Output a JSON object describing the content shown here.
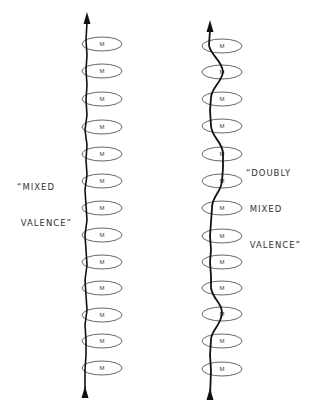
{
  "diagram": {
    "left_chain": {
      "label_lines": [
        "“MIXED",
        " VALENCE”"
      ],
      "site_label": "M",
      "site_count": 13,
      "site_centers_y": [
        44,
        71,
        99,
        127,
        154,
        181,
        208,
        235,
        262,
        288,
        315,
        341,
        368
      ],
      "center_x": 102,
      "path_x": 86
    },
    "right_chain": {
      "label_lines": [
        "“DOUBLY",
        " MIXED",
        " VALENCE”"
      ],
      "site_label": "M",
      "site_count": 13,
      "site_centers_y": [
        46,
        72,
        99,
        126,
        154,
        181,
        208,
        236,
        262,
        288,
        314,
        341,
        369
      ],
      "center_x": 222
    },
    "colors": {
      "line": "#111111",
      "ellipse_stroke": "#555555",
      "text": "#333333"
    }
  }
}
